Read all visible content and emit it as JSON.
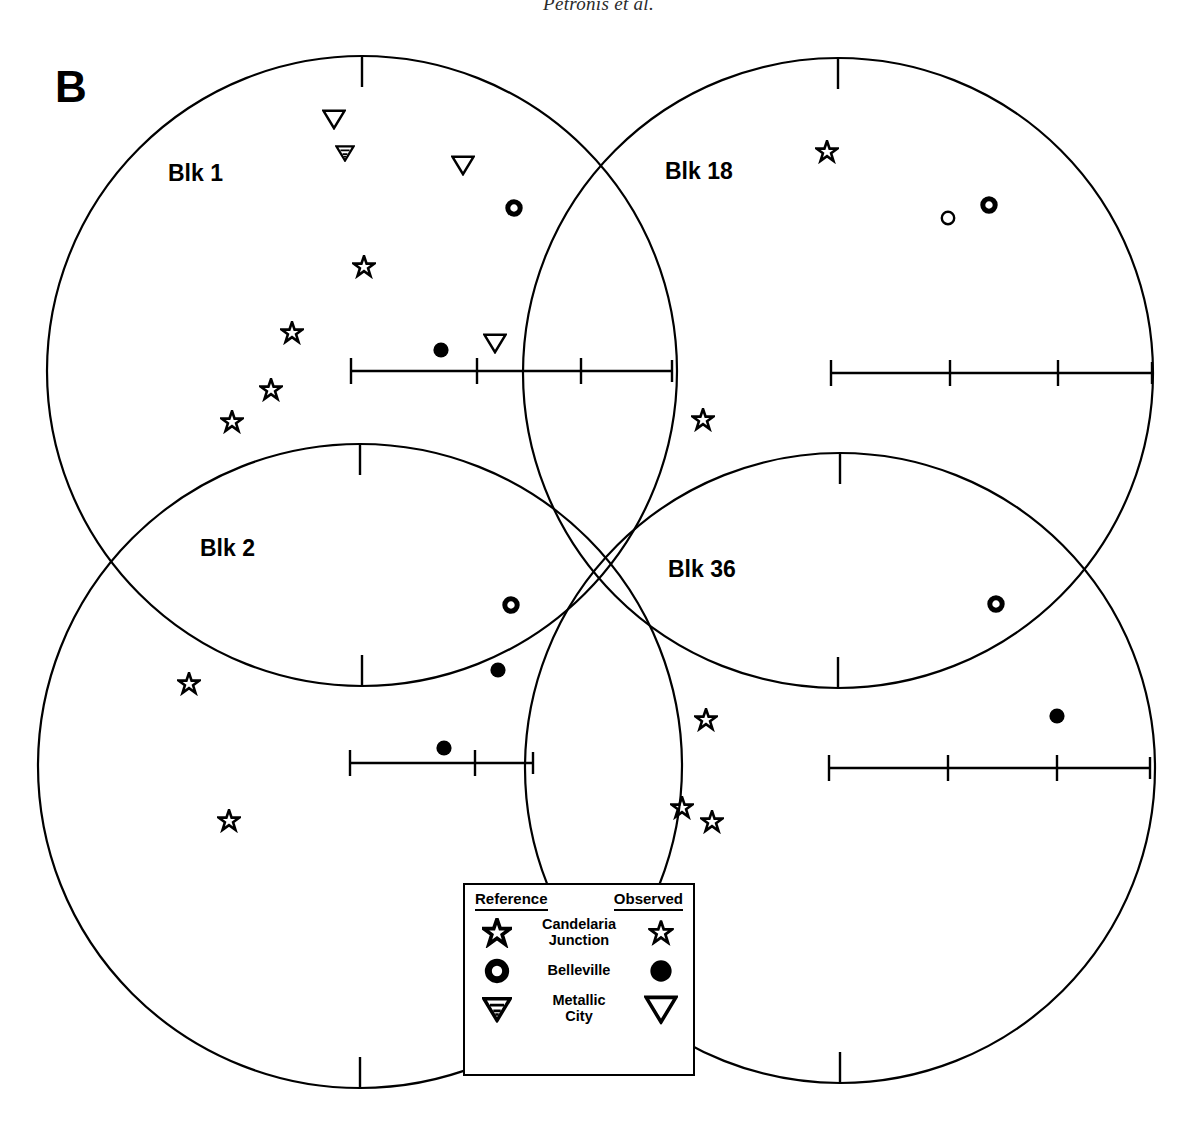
{
  "running_head": "Petronis et al.",
  "panel": {
    "letter": "B"
  },
  "colors": {
    "ink": "#000000",
    "background": "#ffffff"
  },
  "stereonets": [
    {
      "id": "blk1",
      "label": "Blk 1",
      "label_pos": {
        "x": 168,
        "y": 162
      },
      "center": {
        "x": 362,
        "y": 371
      },
      "radius": 315,
      "north_tick": {
        "length": 31
      },
      "axis": {
        "x1": 351,
        "x2": 672,
        "y": 371,
        "ticks": [
          351,
          477,
          581
        ],
        "tick_half": 13,
        "end_tick_half": 11
      },
      "points": [
        {
          "type": "metallic-city-observed",
          "x": 334,
          "y": 119
        },
        {
          "type": "metallic-city-reference",
          "x": 345,
          "y": 153
        },
        {
          "type": "metallic-city-observed",
          "x": 463,
          "y": 165
        },
        {
          "type": "belleville-reference",
          "x": 514,
          "y": 208
        },
        {
          "type": "candelaria-junction-observed",
          "x": 364,
          "y": 267
        },
        {
          "type": "candelaria-junction-observed",
          "x": 292,
          "y": 333
        },
        {
          "type": "belleville-observed",
          "x": 441,
          "y": 350
        },
        {
          "type": "metallic-city-observed",
          "x": 495,
          "y": 343
        },
        {
          "type": "candelaria-junction-observed",
          "x": 271,
          "y": 390
        },
        {
          "type": "candelaria-junction-observed",
          "x": 232,
          "y": 422
        }
      ]
    },
    {
      "id": "blk18",
      "label": "Blk 18",
      "label_pos": {
        "x": 665,
        "y": 160
      },
      "center": {
        "x": 838,
        "y": 373
      },
      "radius": 315,
      "north_tick": {
        "length": 31
      },
      "axis": {
        "x1": 831,
        "x2": 1152,
        "y": 373,
        "ticks": [
          831,
          950,
          1058
        ],
        "tick_half": 13,
        "end_tick_half": 11
      },
      "points": [
        {
          "type": "candelaria-junction-observed",
          "x": 827,
          "y": 152
        },
        {
          "type": "belleville-observed-open",
          "x": 948,
          "y": 218
        },
        {
          "type": "belleville-reference",
          "x": 989,
          "y": 205
        },
        {
          "type": "candelaria-junction-observed",
          "x": 703,
          "y": 420
        }
      ]
    },
    {
      "id": "blk2",
      "label": "Blk 2",
      "label_pos": {
        "x": 200,
        "y": 537
      },
      "center": {
        "x": 360,
        "y": 766
      },
      "radius": 322,
      "north_tick": {
        "length": 31
      },
      "axis": {
        "x1": 350,
        "x2": 533,
        "y": 763,
        "ticks": [
          350,
          475
        ],
        "tick_half": 13,
        "end_tick_half": 11
      },
      "points": [
        {
          "type": "belleville-reference",
          "x": 511,
          "y": 605
        },
        {
          "type": "belleville-observed",
          "x": 498,
          "y": 670
        },
        {
          "type": "candelaria-junction-observed",
          "x": 189,
          "y": 684
        },
        {
          "type": "belleville-observed",
          "x": 444,
          "y": 748
        },
        {
          "type": "candelaria-junction-observed",
          "x": 229,
          "y": 821
        }
      ]
    },
    {
      "id": "blk36",
      "label": "Blk 36",
      "label_pos": {
        "x": 668,
        "y": 558
      },
      "center": {
        "x": 840,
        "y": 768
      },
      "radius": 315,
      "north_tick": {
        "length": 31
      },
      "axis": {
        "x1": 829,
        "x2": 1150,
        "y": 768,
        "ticks": [
          829,
          948,
          1057
        ],
        "tick_half": 13,
        "end_tick_half": 11
      },
      "points": [
        {
          "type": "belleville-reference",
          "x": 996,
          "y": 604
        },
        {
          "type": "candelaria-junction-observed",
          "x": 706,
          "y": 720
        },
        {
          "type": "belleville-observed",
          "x": 1057,
          "y": 716
        },
        {
          "type": "candelaria-junction-observed",
          "x": 682,
          "y": 808
        },
        {
          "type": "candelaria-junction-observed",
          "x": 712,
          "y": 822
        }
      ]
    }
  ],
  "legend": {
    "box": {
      "x": 463,
      "y": 883,
      "width": 232,
      "height": 193
    },
    "header": {
      "reference": "Reference",
      "observed": "Observed"
    },
    "rows": [
      {
        "name": "Candelaria\nJunction",
        "name_line1": "Candelaria",
        "name_line2": "Junction",
        "reference_icon": "star-reference-icon",
        "observed_icon": "star-observed-icon"
      },
      {
        "name": "Belleville",
        "name_line1": "Belleville",
        "name_line2": "",
        "reference_icon": "circle-reference-icon",
        "observed_icon": "circle-filled-icon"
      },
      {
        "name": "Metallic\nCity",
        "name_line1": "Metallic",
        "name_line2": "City",
        "reference_icon": "triangle-reference-icon",
        "observed_icon": "triangle-observed-icon"
      }
    ]
  },
  "chart_data": {
    "type": "scatter",
    "subtitle": "Panel B",
    "projection": "equal-area lower hemisphere stereonet",
    "grid": false,
    "legend_position": "bottom-center",
    "series": [
      {
        "name": "Candelaria Junction",
        "marker": "star"
      },
      {
        "name": "Belleville",
        "marker": "circle"
      },
      {
        "name": "Metallic City",
        "marker": "triangle-down"
      }
    ],
    "panels": [
      {
        "name": "Blk 1",
        "points": [
          {
            "series": "Metallic City",
            "kind": "observed",
            "px": 334,
            "py": 119
          },
          {
            "series": "Metallic City",
            "kind": "reference",
            "px": 345,
            "py": 153
          },
          {
            "series": "Metallic City",
            "kind": "observed",
            "px": 463,
            "py": 165
          },
          {
            "series": "Belleville",
            "kind": "reference",
            "px": 514,
            "py": 208
          },
          {
            "series": "Candelaria Junction",
            "kind": "observed",
            "px": 364,
            "py": 267
          },
          {
            "series": "Candelaria Junction",
            "kind": "observed",
            "px": 292,
            "py": 333
          },
          {
            "series": "Belleville",
            "kind": "observed",
            "px": 441,
            "py": 350
          },
          {
            "series": "Metallic City",
            "kind": "observed",
            "px": 495,
            "py": 343
          },
          {
            "series": "Candelaria Junction",
            "kind": "observed",
            "px": 271,
            "py": 390
          },
          {
            "series": "Candelaria Junction",
            "kind": "observed",
            "px": 232,
            "py": 422
          }
        ]
      },
      {
        "name": "Blk 18",
        "points": [
          {
            "series": "Candelaria Junction",
            "kind": "observed",
            "px": 827,
            "py": 152
          },
          {
            "series": "Belleville",
            "kind": "observed",
            "px": 948,
            "py": 218
          },
          {
            "series": "Belleville",
            "kind": "reference",
            "px": 989,
            "py": 205
          },
          {
            "series": "Candelaria Junction",
            "kind": "observed",
            "px": 703,
            "py": 420
          }
        ]
      },
      {
        "name": "Blk 2",
        "points": [
          {
            "series": "Belleville",
            "kind": "reference",
            "px": 511,
            "py": 605
          },
          {
            "series": "Belleville",
            "kind": "observed",
            "px": 498,
            "py": 670
          },
          {
            "series": "Candelaria Junction",
            "kind": "observed",
            "px": 189,
            "py": 684
          },
          {
            "series": "Belleville",
            "kind": "observed",
            "px": 444,
            "py": 748
          },
          {
            "series": "Candelaria Junction",
            "kind": "observed",
            "px": 229,
            "py": 821
          }
        ]
      },
      {
        "name": "Blk 36",
        "points": [
          {
            "series": "Belleville",
            "kind": "reference",
            "px": 996,
            "py": 604
          },
          {
            "series": "Candelaria Junction",
            "kind": "observed",
            "px": 706,
            "py": 720
          },
          {
            "series": "Belleville",
            "kind": "observed",
            "px": 1057,
            "py": 716
          },
          {
            "series": "Candelaria Junction",
            "kind": "observed",
            "px": 682,
            "py": 808
          },
          {
            "series": "Candelaria Junction",
            "kind": "observed",
            "px": 712,
            "py": 822
          }
        ]
      }
    ]
  }
}
